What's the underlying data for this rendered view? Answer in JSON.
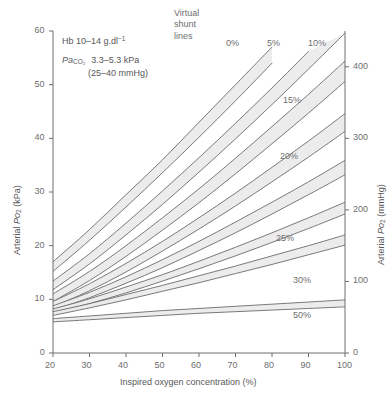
{
  "chart_data": {
    "type": "line",
    "xlabel": "Inspired oxygen concentration (%)",
    "ylabel": "Arterial Po2 (kPa)",
    "ylabel_right": "Arterial Po2 (mmHg)",
    "xlim": [
      20,
      100
    ],
    "ylim": [
      0,
      60
    ],
    "ylim_right": [
      0,
      450
    ],
    "xticks": [
      20,
      30,
      40,
      50,
      60,
      70,
      80,
      90,
      100
    ],
    "yticks": [
      0,
      10,
      20,
      30,
      40,
      50,
      60
    ],
    "yticks_right": [
      0,
      100,
      200,
      300,
      400
    ],
    "grid": false,
    "legend": "none",
    "band_fill": "#ececec",
    "band_edge": "#6b6b6b",
    "series_label": "Virtual shunt lines",
    "series": [
      {
        "name": "0%",
        "label": "0%",
        "label_x": 226,
        "label_y": 38,
        "upper": [
          [
            20,
            17.0
          ],
          [
            30,
            23.0
          ],
          [
            40,
            29.5
          ],
          [
            50,
            36.0
          ],
          [
            60,
            43.0
          ],
          [
            70,
            50.0
          ],
          [
            80,
            57.0
          ],
          [
            85,
            60.5
          ]
        ],
        "lower": [
          [
            20,
            15.2
          ],
          [
            30,
            21.0
          ],
          [
            40,
            27.2
          ],
          [
            50,
            33.6
          ],
          [
            60,
            40.2
          ],
          [
            70,
            47.0
          ],
          [
            80,
            54.0
          ],
          [
            88,
            60.5
          ]
        ]
      },
      {
        "name": "5%",
        "label": "5%",
        "label_x": 267,
        "label_y": 38,
        "upper": [
          [
            20,
            13.4
          ],
          [
            30,
            18.5
          ],
          [
            40,
            24.2
          ],
          [
            50,
            30.2
          ],
          [
            60,
            36.4
          ],
          [
            70,
            42.8
          ],
          [
            80,
            49.4
          ],
          [
            90,
            56.2
          ],
          [
            96,
            60.5
          ]
        ],
        "lower": [
          [
            20,
            11.8
          ],
          [
            30,
            16.6
          ],
          [
            40,
            22.0
          ],
          [
            50,
            27.7
          ],
          [
            60,
            33.7
          ],
          [
            70,
            39.9
          ],
          [
            80,
            46.3
          ],
          [
            90,
            52.9
          ],
          [
            100,
            59.6
          ]
        ]
      },
      {
        "name": "10%",
        "label": "10%",
        "label_x": 308,
        "label_y": 38,
        "upper": [
          [
            20,
            11.0
          ],
          [
            30,
            15.2
          ],
          [
            40,
            20.0
          ],
          [
            50,
            25.2
          ],
          [
            60,
            30.6
          ],
          [
            70,
            36.3
          ],
          [
            80,
            42.2
          ],
          [
            90,
            48.2
          ],
          [
            100,
            54.4
          ]
        ],
        "lower": [
          [
            20,
            9.6
          ],
          [
            30,
            13.5
          ],
          [
            40,
            18.0
          ],
          [
            50,
            22.9
          ],
          [
            60,
            28.0
          ],
          [
            70,
            33.4
          ],
          [
            80,
            39.0
          ],
          [
            90,
            44.7
          ],
          [
            100,
            50.6
          ]
        ]
      },
      {
        "name": "15%",
        "label": "15%",
        "label_x": 283,
        "label_y": 95,
        "upper": [
          [
            20,
            9.6
          ],
          [
            30,
            12.9
          ],
          [
            40,
            16.7
          ],
          [
            50,
            20.8
          ],
          [
            60,
            25.2
          ],
          [
            70,
            29.8
          ],
          [
            80,
            34.6
          ],
          [
            90,
            39.5
          ],
          [
            100,
            44.6
          ]
        ],
        "lower": [
          [
            20,
            8.6
          ],
          [
            30,
            11.6
          ],
          [
            40,
            15.1
          ],
          [
            50,
            19.0
          ],
          [
            60,
            23.1
          ],
          [
            70,
            27.4
          ],
          [
            80,
            31.9
          ],
          [
            90,
            36.5
          ],
          [
            100,
            41.3
          ]
        ]
      },
      {
        "name": "20%",
        "label": "20%",
        "label_x": 280,
        "label_y": 151,
        "upper": [
          [
            20,
            8.8
          ],
          [
            30,
            11.3
          ],
          [
            40,
            14.2
          ],
          [
            50,
            17.4
          ],
          [
            60,
            20.8
          ],
          [
            70,
            24.4
          ],
          [
            80,
            28.1
          ],
          [
            90,
            31.9
          ],
          [
            100,
            35.9
          ]
        ],
        "lower": [
          [
            20,
            8.0
          ],
          [
            30,
            10.3
          ],
          [
            40,
            13.0
          ],
          [
            50,
            15.9
          ],
          [
            60,
            19.1
          ],
          [
            70,
            22.4
          ],
          [
            80,
            25.9
          ],
          [
            90,
            29.5
          ],
          [
            100,
            33.2
          ]
        ]
      },
      {
        "name": "25%",
        "label": "25%",
        "label_x": 276,
        "label_y": 233,
        "upper": [
          [
            20,
            8.2
          ],
          [
            30,
            10.1
          ],
          [
            40,
            12.3
          ],
          [
            50,
            14.6
          ],
          [
            60,
            17.1
          ],
          [
            70,
            19.7
          ],
          [
            80,
            22.4
          ],
          [
            90,
            25.2
          ],
          [
            100,
            28.1
          ]
        ],
        "lower": [
          [
            20,
            7.5
          ],
          [
            30,
            9.2
          ],
          [
            40,
            11.2
          ],
          [
            50,
            13.4
          ],
          [
            60,
            15.7
          ],
          [
            70,
            18.1
          ],
          [
            80,
            20.6
          ],
          [
            90,
            23.2
          ],
          [
            100,
            25.9
          ]
        ]
      },
      {
        "name": "30%",
        "label": "30%",
        "label_x": 293,
        "label_y": 275,
        "upper": [
          [
            20,
            7.7
          ],
          [
            30,
            9.2
          ],
          [
            40,
            10.9
          ],
          [
            50,
            12.6
          ],
          [
            60,
            14.4
          ],
          [
            70,
            16.2
          ],
          [
            80,
            18.1
          ],
          [
            90,
            20.0
          ],
          [
            100,
            22.0
          ]
        ],
        "lower": [
          [
            20,
            7.0
          ],
          [
            30,
            8.4
          ],
          [
            40,
            9.9
          ],
          [
            50,
            11.5
          ],
          [
            60,
            13.1
          ],
          [
            70,
            14.8
          ],
          [
            80,
            16.5
          ],
          [
            90,
            18.3
          ],
          [
            100,
            20.1
          ]
        ]
      },
      {
        "name": "50%",
        "label": "50%",
        "label_x": 293,
        "label_y": 310,
        "upper": [
          [
            20,
            6.4
          ],
          [
            30,
            6.9
          ],
          [
            40,
            7.4
          ],
          [
            50,
            7.9
          ],
          [
            60,
            8.3
          ],
          [
            70,
            8.7
          ],
          [
            80,
            9.1
          ],
          [
            90,
            9.5
          ],
          [
            100,
            9.9
          ]
        ],
        "lower": [
          [
            20,
            5.8
          ],
          [
            30,
            6.2
          ],
          [
            40,
            6.6
          ],
          [
            50,
            7.0
          ],
          [
            60,
            7.4
          ],
          [
            70,
            7.7
          ],
          [
            80,
            8.0
          ],
          [
            90,
            8.3
          ],
          [
            100,
            8.6
          ]
        ]
      }
    ],
    "annotations": [
      {
        "name": "hb-range",
        "text": "Hb 10–14 g.dl⁻¹"
      },
      {
        "name": "paco2-range",
        "text": "Paco2  3.3–5.3 kPa"
      },
      {
        "name": "paco2-mmhg",
        "text": "(25–40 mmHg)"
      },
      {
        "name": "virtual-shunt-lines",
        "text": "Virtual shunt lines"
      }
    ]
  },
  "annotations": {
    "hb_prefix": "Hb 10–14 g.dl",
    "hb_sup": "−1",
    "paco2_pa": "Pa",
    "paco2_sub": "CO₂",
    "paco2_value": "3.3–5.3 kPa",
    "paco2_mmhg": "(25–40 mmHg)",
    "virtual_line1": "Virtual",
    "virtual_line2": "shunt",
    "virtual_line3": "lines"
  },
  "axes": {
    "x_title": "Inspired oxygen concentration (%)",
    "y_left_prefix": "Arterial ",
    "y_left_po": "Po",
    "y_left_sub": "2",
    "y_left_unit": " (kPa)",
    "y_right_prefix": "Arterial ",
    "y_right_po": "Po",
    "y_right_sub": "2",
    "y_right_unit": " (mmHg)",
    "x_ticks": [
      "20",
      "30",
      "40",
      "50",
      "60",
      "70",
      "80",
      "90",
      "100"
    ],
    "y_ticks_left": [
      "60",
      "50",
      "40",
      "30",
      "20",
      "10",
      "0"
    ],
    "y_ticks_right": [
      "400",
      "300",
      "200",
      "100",
      "0"
    ]
  }
}
